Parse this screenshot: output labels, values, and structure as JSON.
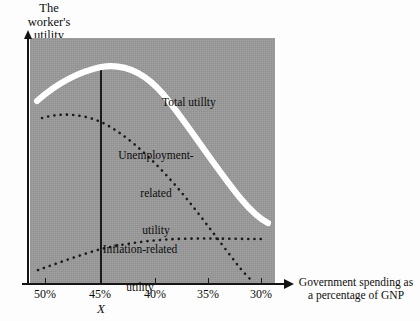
{
  "figure": {
    "y_axis_title_lines": [
      "The",
      "worker's",
      "utility"
    ],
    "x_axis_caption_lines": [
      "Government spending as",
      "a percentage of GNP"
    ],
    "x_marker_label": "X",
    "plot_background_color": "#9a9a9a",
    "total_utility_color": "#ffffff",
    "dotted_curve_color": "#1a1a1a",
    "axis_color": "#141414"
  },
  "labels": {
    "total_utility": [
      "Total utillty"
    ],
    "unemployment_utility": [
      "Unemployment-",
      "related",
      "utility"
    ],
    "inflation_utility": [
      "Inflation-related",
      "utility"
    ]
  },
  "axis": {
    "x_ticks": [
      {
        "label": "50%",
        "x_px": 45
      },
      {
        "label": "45%",
        "x_px": 100
      },
      {
        "label": "40%",
        "x_px": 155
      },
      {
        "label": "35%",
        "x_px": 208
      },
      {
        "label": "30%",
        "x_px": 261
      }
    ]
  },
  "chart_data": {
    "type": "line",
    "title": "",
    "xlabel": "Government spending as a percentage of GNP",
    "ylabel": "The worker's utility",
    "x_tick_labels": [
      "50%",
      "45%",
      "40%",
      "35%",
      "30%"
    ],
    "x_values": [
      50,
      45,
      40,
      35,
      30
    ],
    "x_axis_direction": "decreasing",
    "xlim": [
      52,
      28
    ],
    "ylim": [
      0,
      100
    ],
    "grid": false,
    "legend": "inline-annotations",
    "annotations": [
      {
        "text": "X",
        "x": 45,
        "note": "vertical reference line at the maximum of total utility"
      }
    ],
    "series": [
      {
        "name": "Total utillty",
        "style": "thick-solid-white",
        "color": "#ffffff",
        "x": [
          51.5,
          49,
          47,
          45,
          43,
          41,
          39,
          37,
          35,
          33,
          31.5
        ],
        "y": [
          75,
          82,
          87,
          89,
          88,
          85,
          80,
          72,
          62,
          50,
          42
        ]
      },
      {
        "name": "Unemployment-related utility",
        "style": "dotted",
        "color": "#1a1a1a",
        "x": [
          50.5,
          48,
          46,
          44,
          42,
          40,
          38,
          36,
          34,
          32,
          30.2
        ],
        "y": [
          68,
          67,
          65,
          61,
          56,
          50,
          44,
          37,
          29,
          20,
          9
        ]
      },
      {
        "name": "Inflation-related utility",
        "style": "dotted",
        "color": "#1a1a1a",
        "x": [
          51.2,
          49,
          47,
          45,
          43,
          41,
          39,
          37,
          35,
          33,
          31,
          29.6
        ],
        "y": [
          6,
          9,
          12,
          15,
          17,
          19,
          20,
          21,
          22,
          22,
          22,
          22
        ]
      }
    ]
  }
}
